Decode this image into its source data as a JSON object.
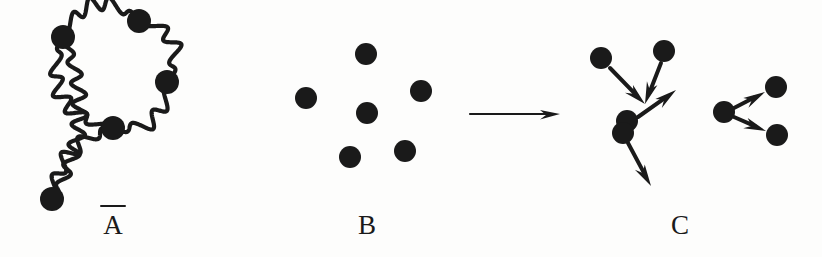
{
  "figure": {
    "width": 822,
    "height": 257,
    "background_color": "#fdfdfc",
    "ink_color": "#1a1a1a"
  },
  "labels": {
    "a": {
      "text": "A",
      "overbar": true
    },
    "b": {
      "text": "B",
      "overbar": false
    },
    "c": {
      "text": "C",
      "overbar": false
    }
  },
  "panel_a": {
    "name": "wavy-polymer-chain",
    "description": "Squiggly wavy chain forming a closed loop with a tail, with filled dots at junctions and ends",
    "dot_radius": 11,
    "stroke_width": 4.2,
    "wave_amplitude": 7.5,
    "wave_period": 21,
    "dots": [
      {
        "id": "a-dot-upper-left",
        "x": 63,
        "y": 37,
        "r": 12
      },
      {
        "id": "a-dot-top-right",
        "x": 139,
        "y": 21,
        "r": 12
      },
      {
        "id": "a-dot-right",
        "x": 167,
        "y": 82,
        "r": 12
      },
      {
        "id": "a-dot-junction",
        "x": 113,
        "y": 128,
        "r": 12
      },
      {
        "id": "a-dot-bottom-end",
        "x": 52,
        "y": 199,
        "r": 12
      }
    ],
    "segments": [
      {
        "id": "a-seg-loop-top-left",
        "from": "a-dot-upper-left",
        "to": "a-dot-top-right",
        "bow": -26
      },
      {
        "id": "a-seg-loop-top-right",
        "from": "a-dot-top-right",
        "to": "a-dot-right",
        "bow": -22
      },
      {
        "id": "a-seg-loop-bottom-right",
        "from": "a-dot-right",
        "to": "a-dot-junction",
        "bow": -20
      },
      {
        "id": "a-seg-loop-left",
        "from": "a-dot-junction",
        "to": "a-dot-upper-left",
        "bow": -30
      },
      {
        "id": "a-seg-tail-outer",
        "from": "a-dot-upper-left",
        "to": "a-dot-bottom-end",
        "bow": -22
      },
      {
        "id": "a-seg-tail-inner",
        "from": "a-dot-junction",
        "to": "a-dot-bottom-end",
        "bow": 16
      }
    ]
  },
  "panel_b": {
    "name": "dispersed-dots",
    "description": "Six separate filled dots scattered with no connections",
    "dot_radius": 11,
    "dots": [
      {
        "id": "b-dot-top",
        "x": 366,
        "y": 54,
        "r": 11
      },
      {
        "id": "b-dot-left",
        "x": 306,
        "y": 98,
        "r": 11
      },
      {
        "id": "b-dot-right",
        "x": 421,
        "y": 91,
        "r": 11
      },
      {
        "id": "b-dot-center",
        "x": 367,
        "y": 113,
        "r": 11
      },
      {
        "id": "b-dot-bottom-left",
        "x": 350,
        "y": 157,
        "r": 11
      },
      {
        "id": "b-dot-bottom-right",
        "x": 405,
        "y": 151,
        "r": 11
      }
    ]
  },
  "transition_arrow": {
    "name": "b-to-c-arrow",
    "x1": 470,
    "y1": 114,
    "x2": 560,
    "y2": 114,
    "stroke_width": 2.2,
    "head_length": 20,
    "head_width": 11
  },
  "panel_c": {
    "name": "aggregating-dots",
    "description": "Two clusters of dots joined by motion arrows indicating aggregation",
    "dot_radius": 11,
    "stroke_width": 4,
    "head_length": 22,
    "head_width": 13,
    "clusters": [
      {
        "id": "c-cluster-left",
        "dots": [
          {
            "id": "c-dot-top-left",
            "x": 601,
            "y": 58,
            "r": 11
          },
          {
            "id": "c-dot-top-right",
            "x": 664,
            "y": 51,
            "r": 11
          },
          {
            "id": "c-dot-pair-upper",
            "x": 627,
            "y": 121,
            "r": 11
          },
          {
            "id": "c-dot-pair-lower",
            "x": 623,
            "y": 133,
            "r": 11
          }
        ],
        "arrows": [
          {
            "id": "c-arrow-in-left",
            "x1": 610,
            "y1": 68,
            "x2": 645,
            "y2": 104
          },
          {
            "id": "c-arrow-in-right",
            "x1": 661,
            "y1": 63,
            "x2": 645,
            "y2": 104
          },
          {
            "id": "c-arrow-out-upper",
            "x1": 638,
            "y1": 117,
            "x2": 676,
            "y2": 90
          },
          {
            "id": "c-arrow-out-lower",
            "x1": 628,
            "y1": 143,
            "x2": 651,
            "y2": 186
          }
        ]
      },
      {
        "id": "c-cluster-right",
        "dots": [
          {
            "id": "c-dot-source",
            "x": 724,
            "y": 112,
            "r": 11
          },
          {
            "id": "c-dot-target-upper",
            "x": 776,
            "y": 87,
            "r": 11
          },
          {
            "id": "c-dot-target-lower",
            "x": 777,
            "y": 135,
            "r": 11
          }
        ],
        "arrows": [
          {
            "id": "c-arrow-right-upper",
            "x1": 734,
            "y1": 108,
            "x2": 765,
            "y2": 92
          },
          {
            "id": "c-arrow-right-lower",
            "x1": 734,
            "y1": 117,
            "x2": 766,
            "y2": 131
          }
        ]
      }
    ]
  }
}
